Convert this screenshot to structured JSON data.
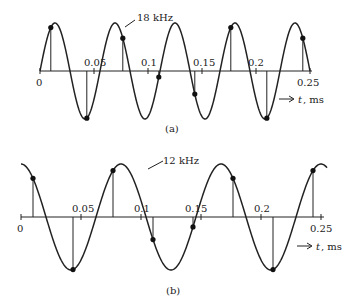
{
  "panels": [
    {
      "id": "a",
      "caption": "(a)",
      "signal_label": "18 kHz",
      "frequency_khz": 18,
      "axis_label": "t, ms",
      "axis_arrow": "→",
      "ticks": [
        "0",
        "0.05",
        "0.1",
        "0.15",
        "0.2",
        "0.25"
      ],
      "sample_rate_khz": 30
    },
    {
      "id": "b",
      "caption": "(b)",
      "signal_label": "12 kHz",
      "frequency_khz": 12,
      "axis_label": "t, ms",
      "axis_arrow": "→",
      "ticks": [
        "0",
        "0.05",
        "0.1",
        "0.15",
        "0.2",
        "0.25"
      ],
      "sample_rate_khz": 30
    }
  ],
  "colors": {
    "line": "#222222",
    "background": "#ffffff"
  }
}
